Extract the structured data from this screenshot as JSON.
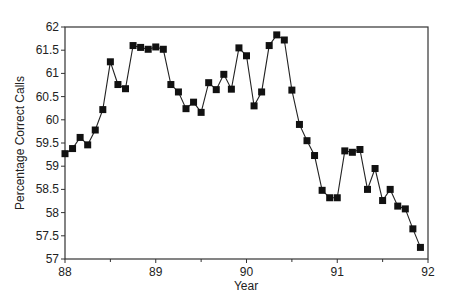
{
  "chart_data": {
    "type": "line",
    "title": "",
    "xlabel": "Year",
    "ylabel": "Percentage Correct Calls",
    "xlim": [
      88,
      92
    ],
    "ylim": [
      57,
      62
    ],
    "x_ticks": [
      "88",
      "89",
      "90",
      "91",
      "92"
    ],
    "y_ticks": [
      "57",
      "57.5",
      "58",
      "58.5",
      "59",
      "59.5",
      "60",
      "60.5",
      "61",
      "61.5",
      "62"
    ],
    "grid": false,
    "legend": null,
    "marker": "square",
    "series": [
      {
        "name": "Percentage Correct Calls",
        "x_start": 88.0,
        "x_step": 0.0833,
        "values": [
          59.27,
          59.38,
          59.62,
          59.46,
          59.78,
          60.22,
          61.25,
          60.76,
          60.67,
          61.6,
          61.56,
          61.52,
          61.57,
          61.52,
          60.76,
          60.6,
          60.24,
          60.38,
          60.16,
          60.8,
          60.65,
          60.98,
          60.66,
          61.55,
          61.38,
          60.3,
          60.6,
          61.6,
          61.83,
          61.72,
          60.64,
          59.9,
          59.55,
          59.23,
          58.48,
          58.32,
          58.32,
          59.33,
          59.3,
          59.36,
          58.5,
          58.95,
          58.26,
          58.5,
          58.14,
          58.08,
          57.65,
          57.25
        ]
      }
    ]
  }
}
